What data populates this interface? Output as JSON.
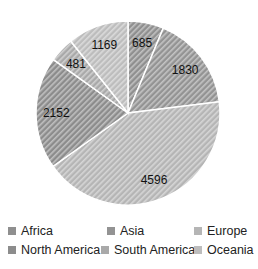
{
  "chart_data": {
    "type": "pie",
    "title": "",
    "categories": [
      "Africa",
      "Asia",
      "Europe",
      "North America",
      "South America",
      "Oceania"
    ],
    "values": [
      685,
      1830,
      4596,
      2152,
      481,
      1169
    ],
    "colors": [
      "#8f8f8f",
      "#939393",
      "#b5b5b5",
      "#8c8c8c",
      "#a9a9a9",
      "#bdbdbd"
    ],
    "data_labels": [
      "685",
      "1830",
      "4596",
      "2152",
      "481",
      "1169"
    ],
    "start_angle": "12 o'clock",
    "direction": "clockwise",
    "fill_pattern": "diagonal hatch",
    "legend_position": "bottom"
  },
  "legend": {
    "items": [
      {
        "label": "Africa",
        "color": "#8f8f8f"
      },
      {
        "label": "Asia",
        "color": "#939393"
      },
      {
        "label": "Europe",
        "color": "#b5b5b5"
      },
      {
        "label": "North America",
        "color": "#8c8c8c"
      },
      {
        "label": "South America",
        "color": "#a9a9a9"
      },
      {
        "label": "Oceania",
        "color": "#bdbdbd"
      }
    ]
  }
}
